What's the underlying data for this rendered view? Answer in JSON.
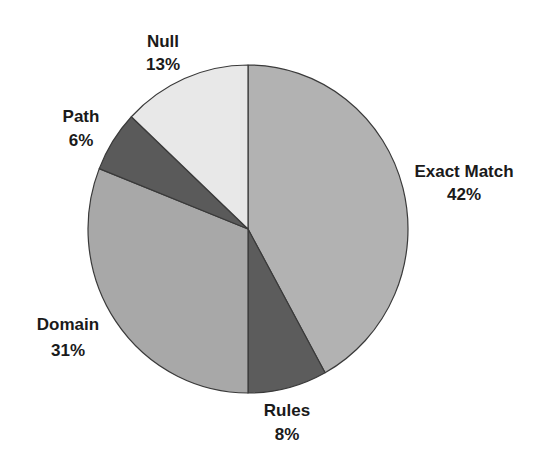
{
  "chart_data": {
    "type": "pie",
    "title": "",
    "start_angle_deg": 0,
    "direction": "clockwise",
    "categories": [
      "Exact Match",
      "Rules",
      "Domain",
      "Path",
      "Null"
    ],
    "values": [
      42,
      8,
      31,
      6,
      13
    ],
    "unit": "%",
    "legend": "none (direct labels)",
    "slices": [
      {
        "label": "Exact Match",
        "value": 42,
        "pct_text": "42%",
        "color": "#b2b2b2"
      },
      {
        "label": "Rules",
        "value": 8,
        "pct_text": "8%",
        "color": "#5c5c5c"
      },
      {
        "label": "Domain",
        "value": 31,
        "pct_text": "31%",
        "color": "#a8a8a8"
      },
      {
        "label": "Path",
        "value": 6,
        "pct_text": "6%",
        "color": "#5a5a5a"
      },
      {
        "label": "Null",
        "value": 13,
        "pct_text": "13%",
        "color": "#e8e8e8"
      }
    ]
  },
  "geometry": {
    "cx": 248,
    "cy": 229,
    "rx": 160,
    "ry": 164
  },
  "labels": [
    {
      "name": "Exact Match",
      "pct": "42%",
      "x": 464,
      "y1": 177,
      "y2": 200
    },
    {
      "name": "Rules",
      "pct": "8%",
      "x": 287,
      "y1": 416,
      "y2": 440
    },
    {
      "name": "Domain",
      "pct": "31%",
      "x": 68,
      "y1": 330,
      "y2": 356
    },
    {
      "name": "Path",
      "pct": "6%",
      "x": 81,
      "y1": 122,
      "y2": 146
    },
    {
      "name": "Null",
      "pct": "13%",
      "x": 163,
      "y1": 47,
      "y2": 70
    }
  ]
}
